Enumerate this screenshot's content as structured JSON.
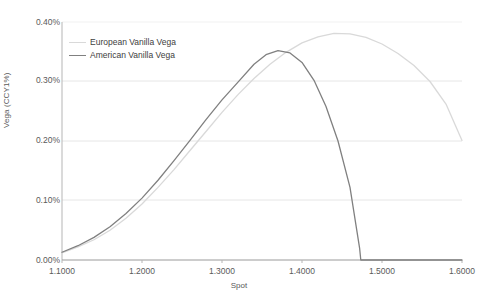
{
  "chart_data": {
    "type": "line",
    "title": "",
    "xlabel": "Spot",
    "ylabel": "Vega (CCY1%)",
    "xlim": [
      1.1,
      1.6
    ],
    "ylim": [
      0.0,
      0.004
    ],
    "grid": true,
    "legend_position": "inside-top-left",
    "xticks": [
      "1.1000",
      "1.2000",
      "1.3000",
      "1.4000",
      "1.5000",
      "1.6000"
    ],
    "xtick_values": [
      1.1,
      1.2,
      1.3,
      1.4,
      1.5,
      1.6
    ],
    "yticks": [
      "0.00%",
      "0.10%",
      "0.20%",
      "0.30%",
      "0.40%"
    ],
    "ytick_values": [
      0.0,
      0.001,
      0.002,
      0.003,
      0.004
    ],
    "series": [
      {
        "name": "European Vanilla Vega",
        "color": "#d9d9d9",
        "width": 1.3,
        "x": [
          1.1,
          1.12,
          1.14,
          1.16,
          1.18,
          1.2,
          1.22,
          1.24,
          1.26,
          1.28,
          1.3,
          1.32,
          1.34,
          1.36,
          1.38,
          1.4,
          1.42,
          1.44,
          1.46,
          1.48,
          1.5,
          1.52,
          1.54,
          1.56,
          1.58,
          1.6
        ],
        "values": [
          0.00012,
          0.00022,
          0.00034,
          0.0005,
          0.0007,
          0.00094,
          0.00122,
          0.00152,
          0.00184,
          0.00216,
          0.00248,
          0.00278,
          0.00305,
          0.00329,
          0.00349,
          0.00365,
          0.00375,
          0.00381,
          0.0038,
          0.00374,
          0.00363,
          0.00347,
          0.00327,
          0.003,
          0.00262,
          0.00201
        ]
      },
      {
        "name": "American Vanilla Vega",
        "color": "#808080",
        "width": 1.3,
        "x": [
          1.1,
          1.12,
          1.14,
          1.16,
          1.18,
          1.2,
          1.22,
          1.24,
          1.26,
          1.28,
          1.3,
          1.32,
          1.34,
          1.355,
          1.37,
          1.385,
          1.4,
          1.415,
          1.43,
          1.445,
          1.46,
          1.472,
          1.4735,
          1.5,
          1.55,
          1.6
        ],
        "values": [
          0.00013,
          0.00024,
          0.00038,
          0.00056,
          0.00078,
          0.00104,
          0.00134,
          0.00167,
          0.00201,
          0.00236,
          0.00269,
          0.00299,
          0.00329,
          0.00345,
          0.00352,
          0.00348,
          0.00332,
          0.00302,
          0.00258,
          0.002,
          0.00122,
          0.0002,
          0.0,
          0.0,
          0.0,
          0.0
        ]
      }
    ],
    "annotations": []
  },
  "plot_box": {
    "left": 62,
    "top": 22,
    "right": 462,
    "bottom": 260
  }
}
